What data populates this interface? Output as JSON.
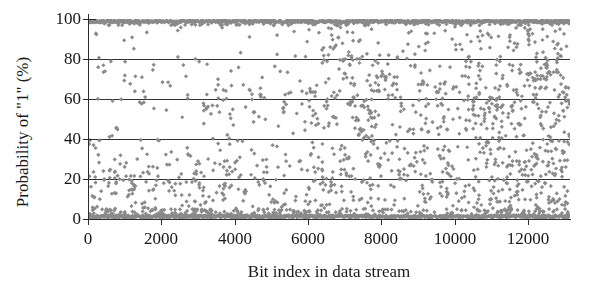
{
  "chart_data": {
    "type": "scatter",
    "title": "",
    "xlabel": "Bit index in data stream",
    "ylabel": "Probability of \"1\" (%)",
    "xlim": [
      0,
      13150
    ],
    "ylim": [
      0,
      100
    ],
    "xticks": [
      0,
      2000,
      4000,
      6000,
      8000,
      10000,
      12000
    ],
    "xtick_labels": [
      "0",
      "2000",
      "4000",
      "6000",
      "8000",
      "10000",
      "12000"
    ],
    "yticks": [
      0,
      20,
      40,
      60,
      80,
      100
    ],
    "ytick_labels": [
      "0",
      "20",
      "40",
      "60",
      "80",
      "100"
    ],
    "gridlines_y": [
      20,
      40,
      60,
      80
    ],
    "grid": "horizontal-only",
    "legend": "none",
    "marker": "diamond",
    "marker_color": "#8a8a8a",
    "marker_size_px": 4,
    "series": [
      {
        "name": "Probability of \"1\"",
        "description": "Bit-wise probability of a '1' across the data stream; values saturate at 0% and 100% with sparse intermediate scatter.",
        "n_points": 1850,
        "saturated_high_fraction": 0.3,
        "saturated_low_fraction": 0.34,
        "mid_fraction": 0.36
      }
    ],
    "axis_color": "#2b2b2b",
    "gridline_color": "#33332f",
    "background": "#ffffff"
  },
  "axes": {
    "x_title": "Bit index in data stream",
    "y_title": "Probability of \"1\" (%)"
  }
}
